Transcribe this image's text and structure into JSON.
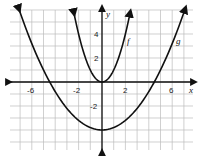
{
  "chart_data": {
    "type": "line",
    "title": "",
    "xlabel": "x",
    "ylabel": "y",
    "xlim": [
      -7.7,
      7.7
    ],
    "ylim": [
      -5.8,
      6
    ],
    "grid": true,
    "x_ticks": [
      "-6",
      "-2",
      "2",
      "6"
    ],
    "y_ticks": [
      "4",
      "2",
      "-2"
    ],
    "series": [
      {
        "name": "f",
        "equation": "y = x^2",
        "vertex": [
          0,
          0
        ]
      },
      {
        "name": "g",
        "equation": "y = x^2/5 - 4",
        "vertex": [
          0,
          -4
        ],
        "x_intercepts": [
          -4.5,
          4.5
        ]
      }
    ]
  },
  "labels": {
    "x_axis": "x",
    "y_axis": "y",
    "f": "f",
    "g": "g",
    "ticks": {
      "xm6": "-6",
      "xm2": "-2",
      "x2": "2",
      "x6": "6",
      "y4": "4",
      "y2": "2",
      "ym2": "-2"
    }
  }
}
